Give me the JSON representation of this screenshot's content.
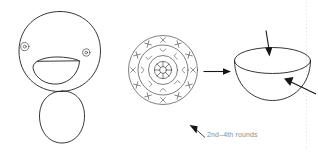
{
  "figure": {
    "background_color": "#ffffff",
    "ink_color": "#231f20",
    "mark_color": "#4a4a4a",
    "caption_color": "#8d8d8d",
    "guide_color": "#d8d8d8",
    "width": 318,
    "height": 156
  },
  "captions": {
    "rounds_label": "2nd–4th rounds"
  },
  "panels": {
    "duck": {
      "name": "duck-character",
      "parts": [
        "head",
        "beak",
        "left-eye",
        "right-eye",
        "body"
      ]
    },
    "mandala": {
      "name": "crochet-round-disc",
      "rings": 3,
      "outer_mark_count": 12,
      "outer_mark_glyph": "X",
      "middle_mark_count": 8,
      "middle_mark_glyph": "curve",
      "center_spoke_count": 8
    },
    "bowl": {
      "name": "hemisphere-bowl",
      "parts": [
        "rim-ellipse",
        "bowl-body"
      ]
    }
  },
  "arrows": {
    "transform_arrow": "points-right",
    "top_arrow": "points-down-to-rim",
    "side_arrow": "points-up-left-into-bowl",
    "caption_arrow": "points-up-left"
  }
}
